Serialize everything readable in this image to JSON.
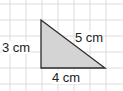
{
  "diagram": {
    "type": "right-triangle-on-grid",
    "grid": {
      "color": "#dcdcdc",
      "spacing_px": 16
    },
    "triangle": {
      "fill": "#d4d4d4",
      "stroke": "#2a2a2a",
      "vertices": [
        [
          41,
          20
        ],
        [
          41,
          68
        ],
        [
          105,
          68
        ]
      ]
    },
    "labels": {
      "left_side": "3 cm",
      "hypotenuse": "5 cm",
      "bottom_side": "4 cm"
    }
  }
}
